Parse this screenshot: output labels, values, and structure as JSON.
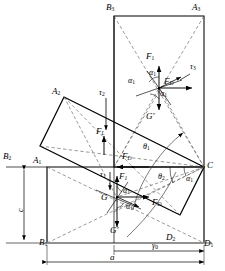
{
  "figure": {
    "type": "engineering-mechanics-diagram",
    "stroke_color": "#000000",
    "background": "#ffffff"
  },
  "vertices": {
    "pos1": {
      "A": "A",
      "A_sub": "1",
      "B": "B",
      "B_sub": "1",
      "C": "C",
      "D": "D",
      "D_sub": "1"
    },
    "pos2": {
      "A": "A",
      "A_sub": "2",
      "B": "B",
      "B_sub": "2",
      "D": "D",
      "D_sub": "2"
    },
    "pos3": {
      "A": "A",
      "A_sub": "3",
      "B": "B",
      "B_sub": "3"
    }
  },
  "labels": [
    {
      "name": "vertex-B3",
      "base": "B",
      "sub": "3",
      "x": 106,
      "y": 6
    },
    {
      "name": "vertex-A3",
      "base": "A",
      "sub": "3",
      "x": 192,
      "y": 6
    },
    {
      "name": "force-F1-top",
      "base": "F",
      "sub": "1",
      "x": 146,
      "y": 57
    },
    {
      "name": "angle-alpha1-top-upper",
      "base": "α",
      "sub": "1",
      "x": 149,
      "y": 74
    },
    {
      "name": "angle-alpha1-top-left",
      "base": "α",
      "sub": "1",
      "x": 130,
      "y": 82
    },
    {
      "name": "force-FD-top",
      "base": "F",
      "sub": "D",
      "x": 163,
      "y": 82
    },
    {
      "name": "torque-tau3",
      "base": "τ",
      "sub": "3",
      "x": 191,
      "y": 68
    },
    {
      "name": "angle-alpha1-top-lower",
      "base": "α",
      "sub": "1",
      "x": 158,
      "y": 95
    },
    {
      "name": "weight-Gprime-top",
      "base": "G'",
      "sub": "",
      "x": 147,
      "y": 117
    },
    {
      "name": "vertex-A2",
      "base": "A",
      "sub": "2",
      "x": 53,
      "y": 91
    },
    {
      "name": "torque-tau2",
      "base": "τ",
      "sub": "2",
      "x": 100,
      "y": 94
    },
    {
      "name": "force-FL",
      "base": "F",
      "sub": "L",
      "x": 98,
      "y": 133
    },
    {
      "name": "angle-theta1",
      "base": "θ",
      "sub": "1",
      "x": 144,
      "y": 148
    },
    {
      "name": "force-FD-mid",
      "base": "F",
      "sub": "D",
      "x": 123,
      "y": 157
    },
    {
      "name": "vertex-B2",
      "base": "B",
      "sub": "2",
      "x": 4,
      "y": 156
    },
    {
      "name": "vertex-A1",
      "base": "A",
      "sub": "1",
      "x": 34,
      "y": 160
    },
    {
      "name": "vertex-C",
      "base": "C",
      "sub": "",
      "x": 207,
      "y": 166
    },
    {
      "name": "torque-tau1",
      "base": "τ",
      "sub": "1",
      "x": 101,
      "y": 176
    },
    {
      "name": "force-F1-low",
      "base": "F",
      "sub": "1",
      "x": 120,
      "y": 177
    },
    {
      "name": "angle-theta2",
      "base": "θ",
      "sub": "2",
      "x": 159,
      "y": 178
    },
    {
      "name": "angle-alpha1-C",
      "base": "α",
      "sub": "1",
      "x": 187,
      "y": 180
    },
    {
      "name": "angle-alpha1-low-upper",
      "base": "α",
      "sub": "1",
      "x": 124,
      "y": 192
    },
    {
      "name": "centroid-G",
      "base": "G",
      "sub": "",
      "x": 102,
      "y": 198
    },
    {
      "name": "force-FD-low",
      "base": "F",
      "sub": "D",
      "x": 152,
      "y": 203
    },
    {
      "name": "angle-alpha1-low-lower",
      "base": "α",
      "sub": "1",
      "x": 127,
      "y": 208
    },
    {
      "name": "weight-Gprime-low",
      "base": "G'",
      "sub": "",
      "x": 111,
      "y": 231
    },
    {
      "name": "vertex-B1",
      "base": "B",
      "sub": "1",
      "x": 40,
      "y": 243
    },
    {
      "name": "vertex-D2",
      "base": "D",
      "sub": "2",
      "x": 167,
      "y": 238
    },
    {
      "name": "vertex-D1",
      "base": "D",
      "sub": "1",
      "x": 204,
      "y": 244
    }
  ],
  "dimensions": [
    {
      "name": "dimension-c",
      "base": "c",
      "sub": "",
      "x": 14,
      "y": 212,
      "rotated": true
    },
    {
      "name": "dimension-gamma0",
      "base": "γ",
      "sub": "0",
      "x": 153,
      "y": 247
    },
    {
      "name": "dimension-a",
      "base": "a",
      "sub": "",
      "x": 111,
      "y": 258
    }
  ]
}
